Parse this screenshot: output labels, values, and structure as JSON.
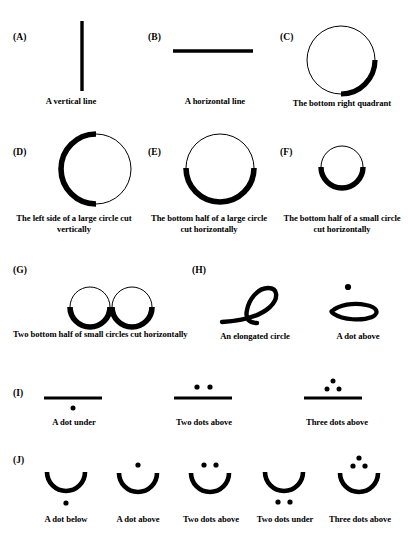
{
  "figure": {
    "background_color": "#ffffff",
    "ink_color": "#000000",
    "groups": [
      {
        "id": "A",
        "label": "(A)",
        "items": [
          {
            "name": "vertical-line",
            "caption": "A vertical line",
            "shape": "vertical-line"
          }
        ]
      },
      {
        "id": "B",
        "label": "(B)",
        "items": [
          {
            "name": "horizontal-line",
            "caption": "A horizontal line",
            "shape": "horizontal-line"
          }
        ]
      },
      {
        "id": "C",
        "label": "(C)",
        "items": [
          {
            "name": "bottom-right-quadrant",
            "caption": "The bottom right quadrant",
            "shape": "circle-arc-bottom-right"
          }
        ]
      },
      {
        "id": "D",
        "label": "(D)",
        "items": [
          {
            "name": "large-circle-left-side",
            "caption": "The left side of a large circle cut vertically",
            "shape": "circle-arc-left"
          }
        ]
      },
      {
        "id": "E",
        "label": "(E)",
        "items": [
          {
            "name": "large-circle-bottom-half",
            "caption": "The bottom half of a large circle cut horizontally",
            "shape": "circle-arc-bottom"
          }
        ]
      },
      {
        "id": "F",
        "label": "(F)",
        "items": [
          {
            "name": "small-circle-bottom-half",
            "caption": "The bottom half of a small circle cut horizontally",
            "shape": "small-circle-arc-bottom"
          }
        ]
      },
      {
        "id": "G",
        "label": "(G)",
        "items": [
          {
            "name": "two-small-circles-bottom-halves",
            "caption": "Two bottom half of small circles cut horizontally",
            "shape": "double-small-circle-arc-bottom"
          }
        ]
      },
      {
        "id": "H",
        "label": "(H)",
        "items": [
          {
            "name": "elongated-circle",
            "caption": "An elongated circle",
            "shape": "elongated-loop"
          },
          {
            "name": "elongated-circle-dot-above",
            "caption": "A dot above",
            "shape": "flat-loop-dot-above"
          }
        ]
      },
      {
        "id": "I",
        "label": "(I)",
        "items": [
          {
            "name": "bar-dot-under",
            "caption": "A dot under",
            "shape": "bar-dot-under"
          },
          {
            "name": "bar-two-dots-above",
            "caption": "Two dots above",
            "shape": "bar-two-dots-above"
          },
          {
            "name": "bar-three-dots-above",
            "caption": "Three dots above",
            "shape": "bar-three-dots-above"
          }
        ]
      },
      {
        "id": "J",
        "label": "(J)",
        "items": [
          {
            "name": "cup-dot-below",
            "caption": "A dot below",
            "shape": "cup-dot-below"
          },
          {
            "name": "cup-dot-above",
            "caption": "A dot above",
            "shape": "cup-dot-above"
          },
          {
            "name": "cup-two-dots-above",
            "caption": "Two dots above",
            "shape": "cup-two-dots-above"
          },
          {
            "name": "cup-two-dots-under",
            "caption": "Two dots under",
            "shape": "cup-two-dots-under"
          },
          {
            "name": "cup-three-dots-above",
            "caption": "Three dots above",
            "shape": "cup-three-dots-above"
          }
        ]
      }
    ]
  }
}
